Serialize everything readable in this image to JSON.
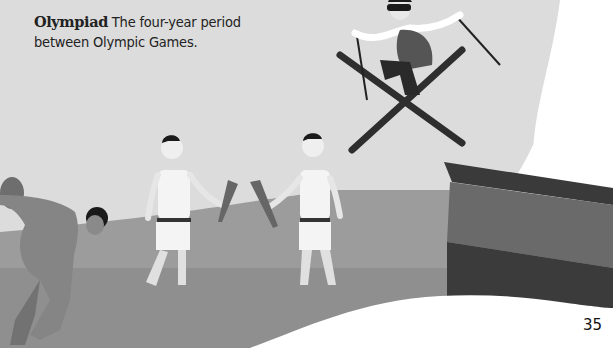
{
  "page": {
    "number": "35"
  },
  "glossary": {
    "entries": [
      {
        "term": "Olympiad",
        "definition": "The four-year period between Olympic Games."
      }
    ]
  },
  "illustration": {
    "scenes": [
      "discus-thrower",
      "torch-bearer-left",
      "torch-bearer-right",
      "ski-jumper",
      "ski-jump-ramp",
      "snow-hill"
    ]
  },
  "colors": {
    "background": "#dcdcdc",
    "ground_light": "#9a9a9a",
    "ground_dark": "#8e8e8e",
    "snow": "#ffffff",
    "ramp_dark": "#3a3a3a",
    "ramp_mid": "#6a6a6a",
    "text": "#222222"
  }
}
